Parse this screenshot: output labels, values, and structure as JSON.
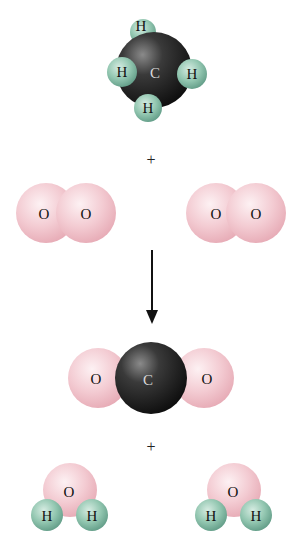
{
  "diagram": {
    "colors": {
      "carbon": "#2b2b2b",
      "hydrogen": "#8ec4ad",
      "oxygen": "#f3c9cf",
      "arrow": "#111111"
    },
    "reactants": [
      {
        "name": "methane",
        "formula": "CH4",
        "atoms": [
          "H",
          "H",
          "C",
          "H",
          "H"
        ]
      },
      {
        "name": "oxygen",
        "formula": "O2",
        "atoms": [
          "O",
          "O"
        ]
      },
      {
        "name": "oxygen",
        "formula": "O2",
        "atoms": [
          "O",
          "O"
        ]
      }
    ],
    "products": [
      {
        "name": "carbon-dioxide",
        "formula": "CO2",
        "atoms": [
          "O",
          "C",
          "O"
        ]
      },
      {
        "name": "water",
        "formula": "H2O",
        "atoms": [
          "O",
          "H",
          "H"
        ]
      },
      {
        "name": "water",
        "formula": "H2O",
        "atoms": [
          "O",
          "H",
          "H"
        ]
      }
    ],
    "plus_1": "+",
    "plus_2": "+"
  }
}
